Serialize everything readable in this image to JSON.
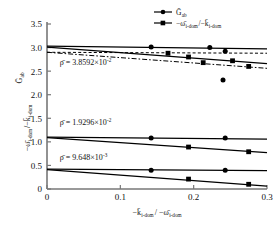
{
  "chart_data": {
    "type": "scatter",
    "title": "",
    "xlabel": "-k̄ i-dom / -ω̄ i-dom",
    "ylabel_line1": "Ḡ ab",
    "ylabel_line2": "-ω̄ i-dom / -k̄ i-dom",
    "xlim": [
      0,
      0.3
    ],
    "ylim": [
      0,
      3.5
    ],
    "xticks": [
      "0",
      "0.1",
      "0.2",
      "0.3"
    ],
    "xtick_values": [
      0,
      0.1,
      0.2,
      0.3
    ],
    "yticks": [
      "0",
      "0.5",
      "1.0",
      "1.5",
      "2.0",
      "2.5",
      "3.0",
      "3.5"
    ],
    "ytick_values": [
      0,
      0.5,
      1.0,
      1.5,
      2.0,
      2.5,
      3.0,
      3.5
    ],
    "grid": false,
    "legend_position": "top-right",
    "legend": [
      {
        "label": "Ḡ ab",
        "marker": "circle",
        "line": "solid"
      },
      {
        "label": "-ω̄ i-dom / -k̄ i-dom",
        "marker": "square",
        "line": "solid"
      }
    ],
    "annotations": [
      {
        "id": "rho-top",
        "text": "ρ̄ = 3.8592×10",
        "exponent": "-2",
        "x": 0.012,
        "y": 2.62
      },
      {
        "id": "rho-mid",
        "text": "ρ̄ = 1.9296×10",
        "exponent": "-2",
        "x": 0.012,
        "y": 1.36
      },
      {
        "id": "rho-bottom",
        "text": "ρ̄ = 9.648×10",
        "exponent": "-3",
        "x": 0.012,
        "y": 0.62
      }
    ],
    "series": [
      {
        "name": "G-ab rho=3.8592e-2",
        "group": "top",
        "marker": "circle",
        "line": "solid",
        "trend": {
          "x0": 0,
          "y0": 3.03,
          "x1": 0.3,
          "y1": 2.97
        },
        "points": [
          {
            "x": 0.142,
            "y": 3.01
          },
          {
            "x": 0.222,
            "y": 3.0
          },
          {
            "x": 0.243,
            "y": 2.92
          },
          {
            "x": 0.24,
            "y": 2.31
          }
        ]
      },
      {
        "name": "omega-over-k rho=3.8592e-2",
        "group": "top",
        "marker": "square",
        "line": "solid",
        "trend": {
          "x0": 0,
          "y0": 3.01,
          "x1": 0.3,
          "y1": 2.66
        },
        "points": [
          {
            "x": 0.165,
            "y": 2.88
          },
          {
            "x": 0.193,
            "y": 2.8
          },
          {
            "x": 0.213,
            "y": 2.68
          },
          {
            "x": 0.253,
            "y": 2.72
          },
          {
            "x": 0.275,
            "y": 2.6
          }
        ]
      },
      {
        "name": "dashed-horizontal-top",
        "group": "top",
        "marker": "none",
        "line": "dashed",
        "trend": {
          "x0": 0,
          "y0": 2.9,
          "x1": 0.3,
          "y1": 2.88
        }
      },
      {
        "name": "dashed-declining-top",
        "group": "top",
        "marker": "none",
        "line": "dashdot",
        "trend": {
          "x0": 0,
          "y0": 2.9,
          "x1": 0.3,
          "y1": 2.56
        }
      },
      {
        "name": "G-ab rho=1.9296e-2",
        "group": "middle",
        "marker": "circle",
        "line": "solid",
        "trend": {
          "x0": 0,
          "y0": 1.1,
          "x1": 0.3,
          "y1": 1.06
        },
        "points": [
          {
            "x": 0.142,
            "y": 1.08
          },
          {
            "x": 0.243,
            "y": 1.08
          }
        ]
      },
      {
        "name": "omega-over-k rho=1.9296e-2",
        "group": "middle",
        "marker": "square",
        "line": "solid",
        "trend": {
          "x0": 0,
          "y0": 1.09,
          "x1": 0.3,
          "y1": 0.77
        },
        "points": [
          {
            "x": 0.193,
            "y": 0.89
          },
          {
            "x": 0.275,
            "y": 0.79
          }
        ]
      },
      {
        "name": "G-ab rho=9.648e-3",
        "group": "bottom",
        "marker": "circle",
        "line": "solid",
        "trend": {
          "x0": 0,
          "y0": 0.42,
          "x1": 0.3,
          "y1": 0.39
        },
        "points": [
          {
            "x": 0.142,
            "y": 0.4
          },
          {
            "x": 0.243,
            "y": 0.4
          }
        ]
      },
      {
        "name": "omega-over-k rho=9.648e-3",
        "group": "bottom",
        "marker": "square",
        "line": "solid",
        "trend": {
          "x0": 0,
          "y0": 0.41,
          "x1": 0.3,
          "y1": 0.06
        },
        "points": [
          {
            "x": 0.193,
            "y": 0.21
          },
          {
            "x": 0.275,
            "y": 0.1
          }
        ]
      }
    ]
  }
}
